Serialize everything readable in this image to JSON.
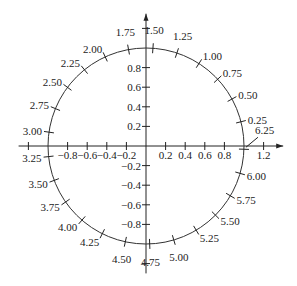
{
  "diagram": {
    "type": "unit-circle",
    "center_px": [
      146,
      146
    ],
    "unit_px": 98,
    "x_axis": {
      "range": [
        -1.3,
        1.4
      ],
      "ticks": [
        -1.2,
        -0.8,
        -0.6,
        -0.4,
        -0.2,
        0.2,
        0.4,
        0.6,
        0.8,
        1.2
      ],
      "labels": [
        {
          "value": -0.8,
          "text": "−0.8"
        },
        {
          "value": -0.6,
          "text": "−0.6"
        },
        {
          "value": -0.4,
          "text": "−0.4"
        },
        {
          "value": -0.2,
          "text": "−0.2"
        },
        {
          "value": 0.2,
          "text": "0.2"
        },
        {
          "value": 0.4,
          "text": "0.4"
        },
        {
          "value": 0.6,
          "text": "0.6"
        },
        {
          "value": 0.8,
          "text": "0.8"
        },
        {
          "value": 1.2,
          "text": "1.2"
        }
      ]
    },
    "y_axis": {
      "range": [
        -1.3,
        1.35
      ],
      "ticks": [
        1.2,
        0.8,
        0.6,
        0.4,
        0.2,
        -0.2,
        -0.4,
        -0.6,
        -0.8,
        -1.2
      ],
      "labels": [
        {
          "value": 0.8,
          "text": "0.8"
        },
        {
          "value": 0.6,
          "text": "0.6"
        },
        {
          "value": 0.4,
          "text": "0.4"
        },
        {
          "value": 0.2,
          "text": "0.2"
        },
        {
          "value": -0.2,
          "text": "−0.2"
        },
        {
          "value": -0.4,
          "text": "−0.4"
        },
        {
          "value": -0.6,
          "text": "−0.6"
        },
        {
          "value": -0.8,
          "text": "−0.8"
        }
      ]
    },
    "circle_marks": [
      {
        "t": 0.25,
        "text": "0.25"
      },
      {
        "t": 0.5,
        "text": "0.50"
      },
      {
        "t": 0.75,
        "text": "0.75"
      },
      {
        "t": 1.0,
        "text": "1.00"
      },
      {
        "t": 1.25,
        "text": "1.25"
      },
      {
        "t": 1.5,
        "text": "1.50"
      },
      {
        "t": 1.75,
        "text": "1.75"
      },
      {
        "t": 2.0,
        "text": "2.00"
      },
      {
        "t": 2.25,
        "text": "2.25"
      },
      {
        "t": 2.5,
        "text": "2.50"
      },
      {
        "t": 2.75,
        "text": "2.75"
      },
      {
        "t": 3.0,
        "text": "3.00"
      },
      {
        "t": 3.25,
        "text": "3.25"
      },
      {
        "t": 3.5,
        "text": "3.50"
      },
      {
        "t": 3.75,
        "text": "3.75"
      },
      {
        "t": 4.0,
        "text": "4.00"
      },
      {
        "t": 4.25,
        "text": "4.25"
      },
      {
        "t": 4.5,
        "text": "4.50"
      },
      {
        "t": 4.75,
        "text": "4.75"
      },
      {
        "t": 5.0,
        "text": "5.00"
      },
      {
        "t": 5.25,
        "text": "5.25"
      },
      {
        "t": 5.5,
        "text": "5.50"
      },
      {
        "t": 5.75,
        "text": "5.75"
      },
      {
        "t": 6.0,
        "text": "6.00"
      },
      {
        "t": 6.25,
        "text": "6.25",
        "leader": true
      }
    ]
  }
}
